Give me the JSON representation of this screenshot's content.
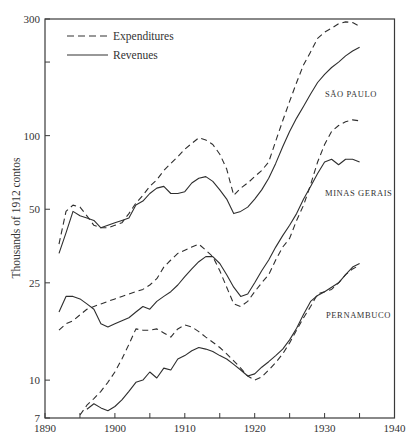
{
  "chart_data": {
    "type": "line",
    "title": "",
    "xlabel": "",
    "ylabel": "Thousands of 1912 contos",
    "yscale": "log",
    "xlim": [
      1890,
      1940
    ],
    "ylim": [
      7,
      300
    ],
    "xticks": [
      1890,
      1900,
      1910,
      1920,
      1930,
      1940
    ],
    "xminor_ticks": [
      1895,
      1905,
      1915,
      1925,
      1935
    ],
    "yticks": [
      7,
      10,
      25,
      50,
      100,
      300
    ],
    "ytick_labels": [
      "7",
      "10",
      "25",
      "50",
      "100",
      "300"
    ],
    "yminor_ticks": [
      200
    ],
    "grid": false,
    "legend": {
      "position": "upper-left",
      "entries": [
        {
          "label": "Expenditures",
          "style": "dashed"
        },
        {
          "label": "Revenues",
          "style": "solid"
        }
      ]
    },
    "annotations": [
      {
        "text": "SÃO PAULO",
        "x": 1929.3,
        "y": 140
      },
      {
        "text": "MINAS GERAIS",
        "x": 1928.5,
        "y": 46
      },
      {
        "text": "PERNAMBUCO",
        "x": 1929,
        "y": 15.5
      }
    ],
    "series": [
      {
        "name": "São Paulo Expenditures",
        "state": "São Paulo",
        "kind": "Expenditures",
        "style": "dashed",
        "x": [
          1892,
          1893,
          1894,
          1895,
          1896,
          1897,
          1898,
          1899,
          1900,
          1901,
          1902,
          1903,
          1904,
          1905,
          1906,
          1907,
          1908,
          1909,
          1910,
          1911,
          1912,
          1913,
          1914,
          1915,
          1916,
          1917,
          1918,
          1919,
          1920,
          1921,
          1922,
          1923,
          1924,
          1925,
          1926,
          1927,
          1928,
          1929,
          1930,
          1931,
          1932,
          1933,
          1934,
          1935
        ],
        "values": [
          36,
          49,
          52,
          51,
          47,
          43,
          42,
          42,
          43,
          44,
          48,
          53,
          57,
          62,
          66,
          72,
          77,
          82,
          88,
          93,
          98,
          96,
          92,
          84,
          73,
          57,
          61,
          64,
          68,
          72,
          78,
          95,
          115,
          138,
          165,
          195,
          220,
          250,
          265,
          275,
          287,
          292,
          290,
          280
        ]
      },
      {
        "name": "São Paulo Revenues",
        "state": "São Paulo",
        "kind": "Revenues",
        "style": "solid",
        "x": [
          1892,
          1893,
          1894,
          1895,
          1896,
          1897,
          1898,
          1899,
          1900,
          1901,
          1902,
          1903,
          1904,
          1905,
          1906,
          1907,
          1908,
          1909,
          1910,
          1911,
          1912,
          1913,
          1914,
          1915,
          1916,
          1917,
          1918,
          1919,
          1920,
          1921,
          1922,
          1923,
          1924,
          1925,
          1926,
          1927,
          1928,
          1929,
          1930,
          1931,
          1932,
          1933,
          1934,
          1935
        ],
        "values": [
          33,
          40,
          49,
          47,
          46,
          45,
          42,
          43,
          44,
          45,
          46,
          52,
          54,
          58,
          61,
          62,
          58,
          58,
          59,
          64,
          67,
          68,
          65,
          60,
          55,
          48,
          49,
          51,
          55,
          60,
          67,
          77,
          90,
          104,
          118,
          132,
          148,
          165,
          178,
          190,
          200,
          212,
          222,
          230
        ]
      },
      {
        "name": "Minas Gerais Expenditures",
        "state": "Minas Gerais",
        "kind": "Expenditures",
        "style": "dashed",
        "x": [
          1892,
          1893,
          1894,
          1895,
          1896,
          1897,
          1898,
          1899,
          1900,
          1901,
          1902,
          1903,
          1904,
          1905,
          1906,
          1907,
          1908,
          1909,
          1910,
          1911,
          1912,
          1913,
          1914,
          1915,
          1916,
          1917,
          1918,
          1919,
          1920,
          1921,
          1922,
          1923,
          1924,
          1925,
          1926,
          1927,
          1928,
          1929,
          1930,
          1931,
          1932,
          1933,
          1934,
          1935
        ],
        "values": [
          16,
          17,
          17.5,
          18.5,
          19.5,
          20,
          20.5,
          21,
          21.5,
          22,
          22.5,
          23,
          23.5,
          24.5,
          26,
          29,
          31,
          33,
          34,
          35,
          36,
          34,
          32,
          28,
          24,
          20.5,
          20,
          21,
          23,
          25,
          27,
          31,
          35,
          38,
          45,
          52,
          63,
          78,
          92,
          104,
          110,
          114,
          116,
          115
        ]
      },
      {
        "name": "Minas Gerais Revenues",
        "state": "Minas Gerais",
        "kind": "Revenues",
        "style": "solid",
        "x": [
          1892,
          1893,
          1894,
          1895,
          1896,
          1897,
          1898,
          1899,
          1900,
          1901,
          1902,
          1903,
          1904,
          1905,
          1906,
          1907,
          1908,
          1909,
          1910,
          1911,
          1912,
          1913,
          1914,
          1915,
          1916,
          1917,
          1918,
          1919,
          1920,
          1921,
          1922,
          1923,
          1924,
          1925,
          1926,
          1927,
          1928,
          1929,
          1930,
          1931,
          1932,
          1933,
          1934,
          1935
        ],
        "values": [
          19,
          22,
          22,
          21.5,
          20.5,
          19.5,
          17,
          16.5,
          17,
          17.5,
          18,
          19,
          20,
          19.5,
          21,
          22,
          23,
          24.5,
          26.5,
          28.5,
          30.5,
          32,
          32,
          30,
          27,
          24,
          22,
          22.5,
          25,
          28,
          31,
          35,
          39,
          43,
          48,
          55,
          62,
          70,
          78,
          80,
          76,
          80,
          80,
          78
        ]
      },
      {
        "name": "Pernambuco Expenditures",
        "state": "Pernambuco",
        "kind": "Expenditures",
        "style": "dashed",
        "x": [
          1895,
          1896,
          1897,
          1898,
          1899,
          1900,
          1901,
          1902,
          1903,
          1904,
          1905,
          1906,
          1907,
          1908,
          1909,
          1910,
          1911,
          1912,
          1913,
          1914,
          1915,
          1916,
          1917,
          1918,
          1919,
          1920,
          1921,
          1922,
          1923,
          1924,
          1925,
          1926,
          1927,
          1928,
          1929,
          1930,
          1931,
          1932,
          1933,
          1934,
          1935
        ],
        "values": [
          7.2,
          7.9,
          8.4,
          9.0,
          9.8,
          10.8,
          12.2,
          14.0,
          16.2,
          16.0,
          16.0,
          16.2,
          15.6,
          15.0,
          16.2,
          16.8,
          16.5,
          15.8,
          15.0,
          14.3,
          13.6,
          12.8,
          12.0,
          11.2,
          10.4,
          10.0,
          10.3,
          11.0,
          11.8,
          12.8,
          14.2,
          16.0,
          18.0,
          20.0,
          22.5,
          23.0,
          23.5,
          25.0,
          27.0,
          28.5,
          29.5
        ]
      },
      {
        "name": "Pernambuco Revenues",
        "state": "Pernambuco",
        "kind": "Revenues",
        "style": "solid",
        "x": [
          1896,
          1897,
          1898,
          1899,
          1900,
          1901,
          1902,
          1903,
          1904,
          1905,
          1906,
          1907,
          1908,
          1909,
          1910,
          1911,
          1912,
          1913,
          1914,
          1915,
          1916,
          1917,
          1918,
          1919,
          1920,
          1921,
          1922,
          1923,
          1924,
          1925,
          1926,
          1927,
          1928,
          1929,
          1930,
          1931,
          1932,
          1933,
          1934,
          1935
        ],
        "values": [
          7.6,
          8.0,
          7.7,
          7.5,
          7.8,
          8.3,
          9.0,
          9.8,
          10.0,
          10.8,
          10.2,
          11.2,
          11.0,
          12.2,
          12.6,
          13.2,
          13.6,
          13.4,
          13.1,
          12.6,
          12.2,
          11.6,
          11.0,
          10.4,
          10.6,
          11.3,
          11.9,
          12.6,
          13.4,
          14.6,
          16.3,
          18.6,
          21.0,
          22.2,
          23.0,
          24.0,
          25.0,
          27.0,
          29.0,
          30.0
        ]
      }
    ]
  }
}
